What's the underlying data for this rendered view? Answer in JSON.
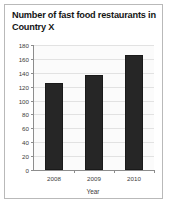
{
  "figure": {
    "title_line1": "Number of fast food restaurants",
    "title_line2": "in Country X",
    "border_color": "#b9b9b9",
    "background": "#ffffff"
  },
  "chart_data": {
    "type": "bar",
    "title": "Number of fast food restaurants in Country X",
    "categories": [
      "2008",
      "2009",
      "2010"
    ],
    "values": [
      125,
      137,
      166
    ],
    "xlabel": "Year",
    "ylabel": "",
    "ylim": [
      0,
      180
    ],
    "ytick_step": 20,
    "yticks": [
      0,
      20,
      40,
      60,
      80,
      100,
      120,
      140,
      160,
      180
    ],
    "ytick_labels": [
      "0",
      "20",
      "40",
      "60",
      "80",
      "100",
      "120",
      "140",
      "160",
      "180"
    ],
    "grid": true,
    "legend": false,
    "bar_color": "#262626",
    "grid_color": "#e2e2e2",
    "axis_color": "#8d8d8d",
    "plot_background": "#fbfbfb"
  }
}
